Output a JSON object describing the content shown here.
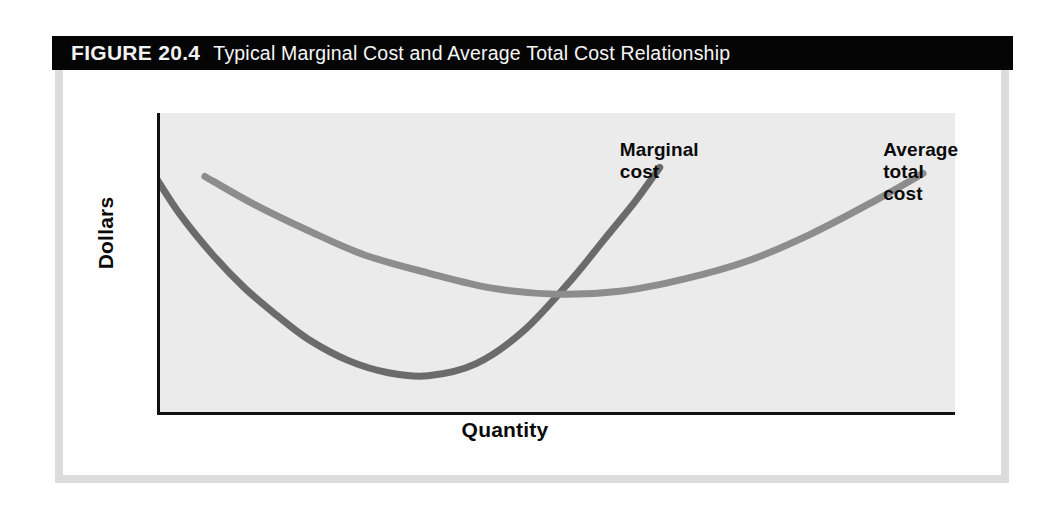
{
  "figure": {
    "label": "FIGURE 20.4",
    "caption": "Typical Marginal Cost and Average Total Cost Relationship",
    "title_bar_color": "#050505",
    "frame_color": "#dcdcdc",
    "page_background": "#ffffff"
  },
  "chart_data": {
    "type": "line",
    "title": "Typical Marginal Cost and Average Total Cost Relationship",
    "xlabel": "Quantity",
    "ylabel": "Dollars",
    "grid": false,
    "legend_position": "inline-curve-labels",
    "plot_background": "#ebebeb",
    "axis_color": "#111111",
    "xlim": [
      0,
      100
    ],
    "ylim": [
      0,
      100
    ],
    "axis_ticks": {
      "x": [],
      "y": []
    },
    "series": [
      {
        "name": "Marginal cost",
        "color": "#6b6b6b",
        "line_width": 7,
        "label": "Marginal\ncost",
        "label_x": 58,
        "label_y": 88,
        "x": [
          0,
          3,
          7,
          11,
          15,
          19,
          24,
          29,
          34,
          40,
          46,
          52,
          56,
          60,
          63
        ],
        "y": [
          78,
          66,
          53,
          42,
          33,
          25,
          18,
          14,
          13,
          17,
          28,
          45,
          58,
          71,
          82
        ]
      },
      {
        "name": "Average total cost",
        "color": "#8d8d8d",
        "line_width": 7,
        "label": "Average\ntotal cost",
        "label_x": 91,
        "label_y": 88,
        "x": [
          6,
          12,
          19,
          26,
          34,
          42,
          50,
          58,
          66,
          74,
          82,
          90,
          96
        ],
        "y": [
          79,
          70,
          61,
          53,
          47,
          42,
          40,
          41,
          45,
          51,
          60,
          71,
          80
        ]
      }
    ],
    "annotations": [
      {
        "name": "mc-atc-intersection",
        "text": "MC intersects ATC at the ATC minimum",
        "x": 50,
        "y": 40
      }
    ]
  },
  "labels": {
    "y_axis": "Dollars",
    "x_axis": "Quantity",
    "marginal_cost_line1": "Marginal",
    "marginal_cost_line2": "cost",
    "average_total_cost_line1": "Average",
    "average_total_cost_line2": "total cost"
  }
}
